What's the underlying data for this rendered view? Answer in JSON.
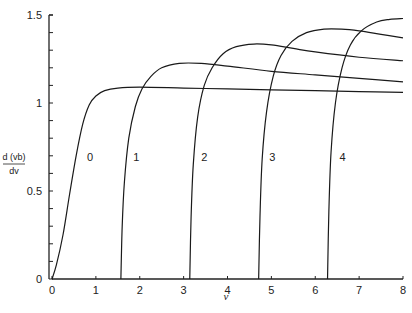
{
  "chart_data": {
    "type": "line",
    "title": "",
    "xlabel": "v",
    "ylabel": "d(vb)/dv",
    "ylabel_numerator": "d (vb)",
    "ylabel_denominator": "dv",
    "xlim": [
      0,
      8
    ],
    "ylim": [
      0,
      1.5
    ],
    "x_ticks": [
      0,
      1,
      2,
      3,
      4,
      5,
      6,
      7,
      8
    ],
    "x_tick_labels": [
      "0",
      "1",
      "2",
      "3",
      "4",
      "5",
      "6",
      "7",
      "8"
    ],
    "y_ticks": [
      0,
      0.5,
      1,
      1.5
    ],
    "y_tick_labels": [
      "0",
      "0.5",
      "1",
      "1.5"
    ],
    "y_minor_tick_step": 0.1,
    "grid": false,
    "legend": "inline curve labels",
    "series": [
      {
        "name": "0",
        "label_pos": [
          0.8,
          0.67
        ],
        "x": [
          0,
          0.1,
          0.25,
          0.4,
          0.55,
          0.7,
          0.85,
          1.0,
          1.2,
          1.5,
          2.0,
          3.0,
          4.0,
          5.0,
          6.0,
          7.0,
          8.0
        ],
        "y": [
          0,
          0.08,
          0.25,
          0.48,
          0.7,
          0.88,
          0.99,
          1.04,
          1.07,
          1.085,
          1.09,
          1.085,
          1.08,
          1.075,
          1.07,
          1.065,
          1.06
        ]
      },
      {
        "name": "1",
        "label_pos": [
          1.85,
          0.67
        ],
        "x": [
          1.57,
          1.6,
          1.65,
          1.75,
          1.9,
          2.05,
          2.25,
          2.5,
          2.9,
          3.4,
          4.0,
          5.0,
          6.0,
          7.0,
          8.0
        ],
        "y": [
          0,
          0.3,
          0.55,
          0.8,
          0.98,
          1.08,
          1.15,
          1.2,
          1.225,
          1.225,
          1.21,
          1.18,
          1.16,
          1.14,
          1.12
        ]
      },
      {
        "name": "2",
        "label_pos": [
          3.4,
          0.67
        ],
        "x": [
          3.14,
          3.17,
          3.22,
          3.32,
          3.47,
          3.65,
          3.9,
          4.2,
          4.6,
          5.0,
          5.5,
          6.0,
          7.0,
          8.0
        ],
        "y": [
          0,
          0.35,
          0.65,
          0.92,
          1.1,
          1.2,
          1.28,
          1.32,
          1.335,
          1.33,
          1.31,
          1.29,
          1.26,
          1.24
        ]
      },
      {
        "name": "3",
        "label_pos": [
          4.95,
          0.67
        ],
        "x": [
          4.71,
          4.74,
          4.79,
          4.89,
          5.04,
          5.22,
          5.47,
          5.8,
          6.2,
          6.6,
          7.0,
          7.5,
          8.0
        ],
        "y": [
          0,
          0.35,
          0.68,
          0.95,
          1.15,
          1.27,
          1.35,
          1.4,
          1.42,
          1.42,
          1.41,
          1.39,
          1.37
        ]
      },
      {
        "name": "4",
        "label_pos": [
          6.55,
          0.67
        ],
        "x": [
          6.28,
          6.31,
          6.36,
          6.46,
          6.61,
          6.8,
          7.05,
          7.4,
          7.7,
          8.0
        ],
        "y": [
          0,
          0.38,
          0.72,
          1.0,
          1.2,
          1.33,
          1.41,
          1.46,
          1.475,
          1.48
        ]
      }
    ]
  }
}
